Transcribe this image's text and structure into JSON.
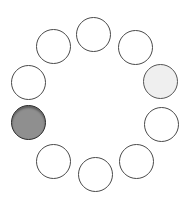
{
  "spinner": {
    "label": "",
    "dot_radius": 17.5,
    "dots": [
      {
        "cx": 93,
        "cy": 34,
        "fill": "#ffffff"
      },
      {
        "cx": 135,
        "cy": 47,
        "fill": "#ffffff"
      },
      {
        "cx": 160,
        "cy": 81,
        "fill": "#efefef"
      },
      {
        "cx": 161,
        "cy": 124,
        "fill": "#ffffff"
      },
      {
        "cx": 136,
        "cy": 161,
        "fill": "#ffffff"
      },
      {
        "cx": 95,
        "cy": 174,
        "fill": "#ffffff"
      },
      {
        "cx": 53,
        "cy": 161,
        "fill": "#ffffff"
      },
      {
        "cx": 28,
        "cy": 122,
        "fill": "#8f8f8f"
      },
      {
        "cx": 28,
        "cy": 82,
        "fill": "#ffffff"
      },
      {
        "cx": 53,
        "cy": 46,
        "fill": "#ffffff"
      }
    ]
  }
}
